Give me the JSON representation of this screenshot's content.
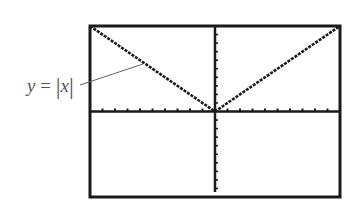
{
  "chart_data": {
    "type": "line",
    "title": "",
    "function": "y = |x|",
    "series": [
      {
        "name": "y = |x|",
        "x": [
          -10,
          -8,
          -6,
          -4,
          -2,
          0,
          2,
          4,
          6,
          8,
          10
        ],
        "values": [
          10,
          8,
          6,
          4,
          2,
          0,
          2,
          4,
          6,
          8,
          10
        ]
      }
    ],
    "xlabel": "",
    "ylabel": "",
    "xlim": [
      -10,
      10
    ],
    "ylim": [
      -10,
      10
    ],
    "xscl": 1,
    "yscl": 1,
    "grid": false,
    "legend": "none",
    "annotation": "y = |x|"
  },
  "label": {
    "lhs": "y",
    "eq": " = ",
    "rhs": "x"
  },
  "colors": {
    "frame": "#1a1a1a",
    "axis": "#1a1a1a",
    "curve": "#1a1a1a",
    "label": "#555555",
    "leader": "#666666",
    "background": "#ffffff"
  }
}
